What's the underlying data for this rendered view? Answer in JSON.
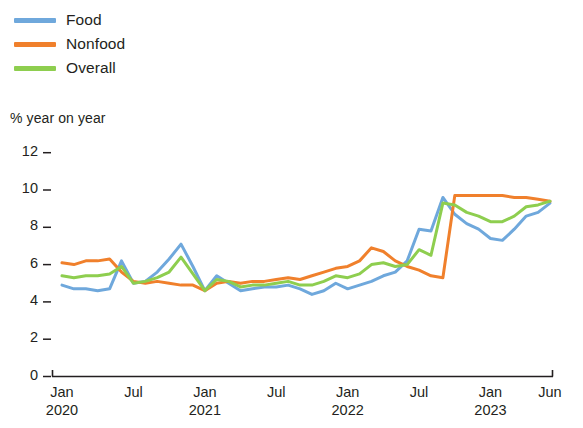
{
  "legend": {
    "position": "top-left",
    "items": [
      {
        "label": "Food",
        "color": "#6fa8dc"
      },
      {
        "label": "Nonfood",
        "color": "#f0802c"
      },
      {
        "label": "Overall",
        "color": "#8ece4f"
      }
    ]
  },
  "axis": {
    "ylabel": "% year on year",
    "yticks": [
      "0",
      "2",
      "4",
      "6",
      "8",
      "10",
      "12"
    ],
    "xticks": [
      {
        "month": "Jan",
        "year": "2020"
      },
      {
        "month": "Jul",
        "year": ""
      },
      {
        "month": "Jan",
        "year": "2021"
      },
      {
        "month": "Jul",
        "year": ""
      },
      {
        "month": "Jan",
        "year": "2022"
      },
      {
        "month": "Jul",
        "year": ""
      },
      {
        "month": "Jan",
        "year": "2023"
      },
      {
        "month": "Jun",
        "year": ""
      }
    ]
  },
  "chart_data": {
    "type": "line",
    "title": "",
    "subtitle": "",
    "xlabel": "",
    "ylabel": "% year on year",
    "ylim": [
      0,
      12.6
    ],
    "yticks": [
      0,
      2,
      4,
      6,
      8,
      10,
      12
    ],
    "grid": false,
    "legend_position": "top-left",
    "x": [
      "Jan 2020",
      "Feb 2020",
      "Mar 2020",
      "Apr 2020",
      "May 2020",
      "Jun 2020",
      "Jul 2020",
      "Aug 2020",
      "Sep 2020",
      "Oct 2020",
      "Nov 2020",
      "Dec 2020",
      "Jan 2021",
      "Feb 2021",
      "Mar 2021",
      "Apr 2021",
      "May 2021",
      "Jun 2021",
      "Jul 2021",
      "Aug 2021",
      "Sep 2021",
      "Oct 2021",
      "Nov 2021",
      "Dec 2021",
      "Jan 2022",
      "Feb 2022",
      "Mar 2022",
      "Apr 2022",
      "May 2022",
      "Jun 2022",
      "Jul 2022",
      "Aug 2022",
      "Sep 2022",
      "Oct 2022",
      "Nov 2022",
      "Dec 2022",
      "Jan 2023",
      "Feb 2023",
      "Mar 2023",
      "Apr 2023",
      "May 2023",
      "Jun 2023"
    ],
    "xtick_labels": [
      "Jan 2020",
      "Jul",
      "Jan 2021",
      "Jul",
      "Jan 2022",
      "Jul",
      "Jan 2023",
      "Jun"
    ],
    "series": [
      {
        "name": "Food",
        "color": "#6fa8dc",
        "values": [
          4.9,
          4.7,
          4.7,
          4.6,
          4.7,
          6.2,
          5.0,
          5.1,
          5.6,
          6.3,
          7.1,
          5.9,
          4.6,
          5.4,
          5.0,
          4.6,
          4.7,
          4.8,
          4.8,
          4.9,
          4.7,
          4.4,
          4.6,
          5.0,
          4.7,
          4.9,
          5.1,
          5.4,
          5.6,
          6.2,
          7.9,
          7.8,
          9.6,
          8.7,
          8.2,
          7.9,
          7.4,
          7.3,
          7.9,
          8.6,
          8.8,
          9.3
        ]
      },
      {
        "name": "Nonfood",
        "color": "#f0802c",
        "values": [
          6.1,
          6.0,
          6.2,
          6.2,
          6.3,
          5.6,
          5.1,
          5.0,
          5.1,
          5.0,
          4.9,
          4.9,
          4.6,
          5.0,
          5.1,
          5.0,
          5.1,
          5.1,
          5.2,
          5.3,
          5.2,
          5.4,
          5.6,
          5.8,
          5.9,
          6.2,
          6.9,
          6.7,
          6.2,
          5.9,
          5.7,
          5.4,
          5.3,
          9.7,
          9.7,
          9.7,
          9.7,
          9.7,
          9.6,
          9.6,
          9.5,
          9.4
        ]
      },
      {
        "name": "Overall",
        "color": "#8ece4f",
        "values": [
          5.4,
          5.3,
          5.4,
          5.4,
          5.5,
          5.9,
          5.0,
          5.1,
          5.3,
          5.6,
          6.4,
          5.5,
          4.6,
          5.2,
          5.1,
          4.8,
          4.9,
          4.9,
          5.0,
          5.1,
          4.9,
          4.9,
          5.1,
          5.4,
          5.3,
          5.5,
          6.0,
          6.1,
          5.9,
          6.0,
          6.8,
          6.5,
          9.3,
          9.2,
          8.8,
          8.6,
          8.3,
          8.3,
          8.6,
          9.1,
          9.2,
          9.4
        ]
      }
    ]
  }
}
